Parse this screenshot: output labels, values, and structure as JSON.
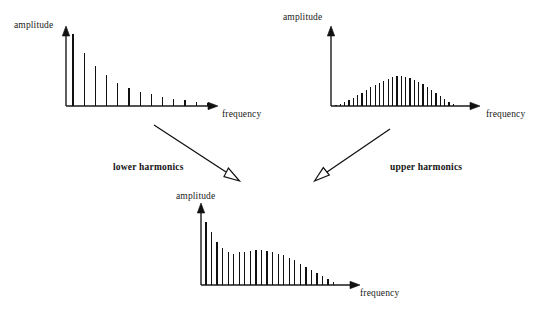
{
  "figure": {
    "title": "",
    "background_color": "#ffffff",
    "ink_color": "#111111"
  },
  "labels": {
    "amplitude": "amplitude",
    "frequency": "frequency",
    "lower_harmonics": "lower harmonics",
    "upper_harmonics": "upper harmonics"
  },
  "chart_data": [
    {
      "id": "lower-harmonics-spectrum",
      "type": "bar",
      "title": "",
      "xlabel": "frequency",
      "ylabel": "amplitude",
      "position": "top-left",
      "grid": false,
      "legend": "none",
      "xlim": [
        0,
        16
      ],
      "ylim": [
        0,
        1
      ],
      "categories": [
        1,
        2,
        3,
        4,
        5,
        6,
        7,
        8,
        9,
        10,
        11,
        12,
        13
      ],
      "values": [
        1.0,
        0.74,
        0.56,
        0.43,
        0.32,
        0.25,
        0.2,
        0.16,
        0.13,
        0.1,
        0.08,
        0.06,
        0.04
      ]
    },
    {
      "id": "upper-harmonics-spectrum",
      "type": "bar",
      "title": "",
      "xlabel": "frequency",
      "ylabel": "amplitude",
      "position": "top-right",
      "grid": false,
      "legend": "none",
      "xlim": [
        0,
        34
      ],
      "ylim": [
        0,
        1
      ],
      "categories": [
        1,
        2,
        3,
        4,
        5,
        6,
        7,
        8,
        9,
        10,
        11,
        12,
        13,
        14,
        15,
        16,
        17,
        18,
        19,
        20,
        21,
        22,
        23,
        24,
        25,
        26,
        27,
        28
      ],
      "values": [
        0.04,
        0.07,
        0.12,
        0.2,
        0.28,
        0.36,
        0.45,
        0.53,
        0.62,
        0.7,
        0.78,
        0.85,
        0.91,
        0.96,
        1.0,
        1.0,
        0.97,
        0.93,
        0.87,
        0.8,
        0.72,
        0.63,
        0.54,
        0.44,
        0.34,
        0.24,
        0.15,
        0.07
      ]
    },
    {
      "id": "combined-spectrum",
      "type": "bar",
      "title": "",
      "xlabel": "frequency",
      "ylabel": "amplitude",
      "position": "bottom-center",
      "grid": false,
      "legend": "none",
      "xlim": [
        0,
        30
      ],
      "ylim": [
        0,
        1
      ],
      "categories": [
        1,
        2,
        3,
        4,
        5,
        6,
        7,
        8,
        9,
        10,
        11,
        12,
        13,
        14,
        15,
        16,
        17,
        18,
        19,
        20,
        21,
        22,
        23,
        24
      ],
      "values": [
        1.0,
        0.84,
        0.69,
        0.58,
        0.52,
        0.5,
        0.52,
        0.53,
        0.54,
        0.55,
        0.55,
        0.54,
        0.52,
        0.5,
        0.47,
        0.43,
        0.39,
        0.34,
        0.29,
        0.24,
        0.19,
        0.14,
        0.09,
        0.05
      ]
    }
  ],
  "arrows": [
    {
      "id": "arrow-lower-to-combined",
      "from": "lower-harmonics-spectrum",
      "to": "combined-spectrum",
      "label": "lower harmonics",
      "head_style": "open-triangle"
    },
    {
      "id": "arrow-upper-to-combined",
      "from": "upper-harmonics-spectrum",
      "to": "combined-spectrum",
      "label": "upper harmonics",
      "head_style": "open-triangle"
    }
  ]
}
